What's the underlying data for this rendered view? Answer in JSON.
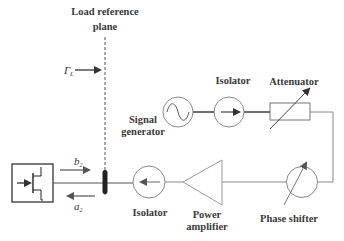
{
  "diagram": {
    "title_line1": "Load reference",
    "title_line2": "plane",
    "gamma_label": "Γ",
    "gamma_sub": "L",
    "b_label": "b",
    "b_sub": "2",
    "a_label": "a",
    "a_sub": "2",
    "components": {
      "signal_generator_line1": "Signal",
      "signal_generator_line2": "generator",
      "isolator_top": "Isolator",
      "attenuator": "Attenuator",
      "isolator_bottom": "Isolator",
      "power_amplifier_line1": "Power",
      "power_amplifier_line2": "amplifier",
      "phase_shifter": "Phase shifter"
    },
    "colors": {
      "line": "#444444",
      "light_line": "#8a8a8a",
      "text": "#3a3a3a",
      "background": "#ffffff"
    }
  }
}
